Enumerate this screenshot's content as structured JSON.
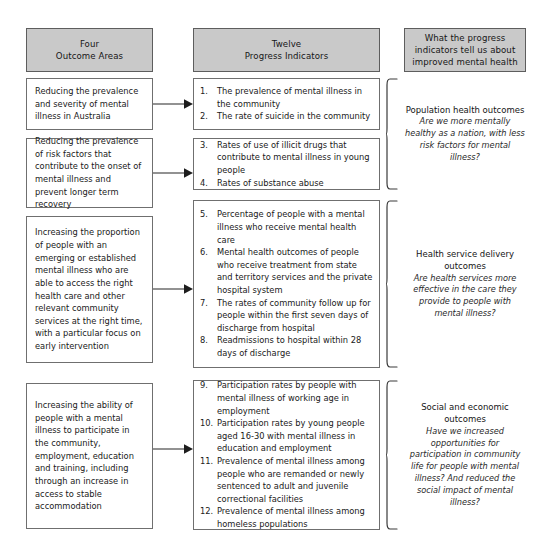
{
  "diagram": {
    "headers": [
      {
        "line1": "Four",
        "line2": "Outcome Areas"
      },
      {
        "line1": "Twelve",
        "line2": "Progress Indicators"
      },
      {
        "line1": "What the progress",
        "line2": "indicators tell us about",
        "line3": "improved mental health"
      }
    ],
    "outcome_areas": [
      {
        "id": "outcome-1",
        "text": "Reducing the prevalence and severity of mental illness in Australia"
      },
      {
        "id": "outcome-2",
        "text": "Reducing the prevalence of risk factors that contribute to the onset of mental illness and prevent longer term recovery"
      },
      {
        "id": "outcome-3",
        "text": "Increasing the proportion of people with an emerging or established mental illness who are able to access the right health care and other relevant community services at the right time, with a particular focus on early intervention"
      },
      {
        "id": "outcome-4",
        "text": "Increasing the ability of people with a mental illness to participate in the community, employment, education and training, including through an increase in access to stable accommodation"
      }
    ],
    "indicator_groups": [
      {
        "id": "indicator-group-1",
        "items": [
          {
            "num": "1.",
            "text": "The prevalence of mental illness in the community"
          },
          {
            "num": "2.",
            "text": "The rate of suicide in the community"
          }
        ]
      },
      {
        "id": "indicator-group-2",
        "items": [
          {
            "num": "3.",
            "text": "Rates of use of illicit drugs that contribute to mental illness in young people"
          },
          {
            "num": "4.",
            "text": "Rates of substance abuse"
          }
        ]
      },
      {
        "id": "indicator-group-3",
        "items": [
          {
            "num": "5.",
            "text": "Percentage of people with a mental illness who receive mental health care"
          },
          {
            "num": "6.",
            "text": "Mental health outcomes of people who receive treatment from state and territory services and the private hospital system"
          },
          {
            "num": "7.",
            "text": "The rates of community follow up for people within the first seven days of discharge from hospital"
          },
          {
            "num": "8.",
            "text": "Readmissions to hospital within 28 days of discharge"
          }
        ]
      },
      {
        "id": "indicator-group-4",
        "items": [
          {
            "num": "9.",
            "text": "Participation rates by people with mental illness of working age in employment"
          },
          {
            "num": "10.",
            "text": "Participation rates by young people aged 16-30 with mental illness in education and employment"
          },
          {
            "num": "11.",
            "text": "Prevalence of mental illness among people who are remanded or newly sentenced to adult and juvenile correctional facilities"
          },
          {
            "num": "12.",
            "text": "Prevalence of mental illness among homeless populations"
          }
        ]
      }
    ],
    "summaries": [
      {
        "id": "summary-population-health",
        "title": "Population health outcomes",
        "question": "Are we more mentally healthy as a nation, with less risk factors for mental illness?"
      },
      {
        "id": "summary-health-service-delivery",
        "title": "Health service delivery outcomes",
        "question": "Are health services more effective in the care they provide to people with mental illness?"
      },
      {
        "id": "summary-social-economic",
        "title": "Social and economic outcomes",
        "question": "Have we increased opportunities for participation in community life for people with mental illness? And reduced the social impact of mental illness?"
      }
    ],
    "colors": {
      "header_fill": "#c9c9c9",
      "box_border": "#6f6f6f",
      "text": "#1a1a1a",
      "background": "#ffffff"
    }
  }
}
